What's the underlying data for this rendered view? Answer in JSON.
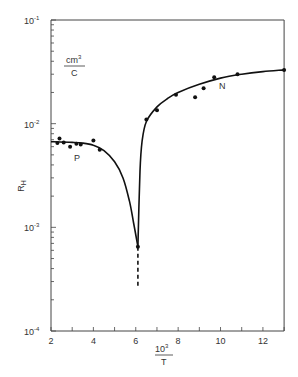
{
  "chart_data": {
    "type": "scatter",
    "title": "",
    "xlabel": "10^3 / T",
    "ylabel": "R_H",
    "yunits": "cm^3 / C",
    "xlim": [
      2,
      13
    ],
    "ylim": [
      0.0001,
      0.1
    ],
    "yscale": "log",
    "grid": false,
    "x_ticks": [
      2,
      4,
      6,
      8,
      10,
      12
    ],
    "y_ticks": [
      "10^-4",
      "10^-3",
      "10^-2",
      "10^-1"
    ],
    "annotations": [
      {
        "text": "P",
        "x": 3.2,
        "y": 0.0045
      },
      {
        "text": "N",
        "x": 9.3,
        "y": 0.026
      }
    ],
    "series": [
      {
        "name": "P",
        "points": [
          [
            2.3,
            0.0065
          ],
          [
            2.4,
            0.0072
          ],
          [
            2.6,
            0.0066
          ],
          [
            2.9,
            0.006
          ],
          [
            3.2,
            0.0064
          ],
          [
            3.4,
            0.0063
          ],
          [
            4.0,
            0.0069
          ],
          [
            4.3,
            0.0056
          ]
        ]
      },
      {
        "name": "minimum",
        "points": [
          [
            6.1,
            0.00065
          ]
        ]
      },
      {
        "name": "N",
        "points": [
          [
            6.5,
            0.011
          ],
          [
            7.0,
            0.0135
          ],
          [
            7.9,
            0.019
          ],
          [
            8.8,
            0.018
          ],
          [
            9.2,
            0.022
          ],
          [
            9.7,
            0.028
          ],
          [
            10.8,
            0.03
          ],
          [
            13.0,
            0.033
          ]
        ]
      }
    ],
    "fit_curve": {
      "p_branch": [
        [
          2.0,
          0.0067
        ],
        [
          3.0,
          0.0066
        ],
        [
          3.5,
          0.0065
        ],
        [
          4.0,
          0.0062
        ],
        [
          4.5,
          0.0055
        ],
        [
          5.0,
          0.0043
        ],
        [
          5.4,
          0.003
        ],
        [
          5.7,
          0.0018
        ],
        [
          5.9,
          0.0011
        ],
        [
          6.1,
          0.00065
        ]
      ],
      "n_branch": [
        [
          6.1,
          0.00065
        ],
        [
          6.2,
          0.0035
        ],
        [
          6.3,
          0.0068
        ],
        [
          6.5,
          0.0105
        ],
        [
          7.0,
          0.0145
        ],
        [
          7.5,
          0.0175
        ],
        [
          8.0,
          0.02
        ],
        [
          9.0,
          0.024
        ],
        [
          10.0,
          0.0275
        ],
        [
          11.0,
          0.03
        ],
        [
          12.0,
          0.0318
        ],
        [
          13.0,
          0.033
        ]
      ],
      "dashed_extension": [
        [
          6.1,
          0.00065
        ],
        [
          6.1,
          0.00026
        ]
      ]
    }
  },
  "labels": {
    "y_unit_num": "cm",
    "y_unit_exp": "3",
    "y_unit_den": "C",
    "y_axis": "R",
    "y_axis_sub": "H",
    "x_axis_num": "10",
    "x_axis_exp": "3",
    "x_axis_den": "T",
    "p_label": "P",
    "n_label": "N",
    "ytick_base": "10",
    "ytick_exps": [
      "-1",
      "-2",
      "-3",
      "-4"
    ],
    "xticks": [
      "2",
      "4",
      "6",
      "8",
      "10",
      "12"
    ]
  }
}
